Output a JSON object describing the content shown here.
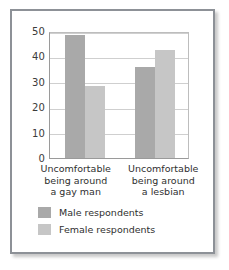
{
  "chart_data": {
    "type": "bar",
    "title": "",
    "subtitle": "",
    "xlabel": "",
    "ylabel": "",
    "ylim": [
      0,
      50
    ],
    "yticks": [
      0,
      10,
      20,
      30,
      40,
      50
    ],
    "grid": true,
    "legend_position": "bottom-left",
    "categories": [
      "Uncomfortable being around a gay man",
      "Uncomfortable being around a lesbian"
    ],
    "category_lines": [
      [
        "Uncomfortable",
        "being around",
        "a gay man"
      ],
      [
        "Uncomfortable",
        "being around",
        "a lesbian"
      ]
    ],
    "series": [
      {
        "name": "Male respondents",
        "color": "#a9a9a9",
        "values": [
          48.5,
          36
        ]
      },
      {
        "name": "Female respondents",
        "color": "#c6c6c6",
        "values": [
          28.5,
          42.5
        ]
      }
    ]
  },
  "figure": {
    "border_color": "#8d9197",
    "background": "#ffffff",
    "axis_color": "#9a9a9a",
    "gridline_color": "#cfcfcf"
  }
}
